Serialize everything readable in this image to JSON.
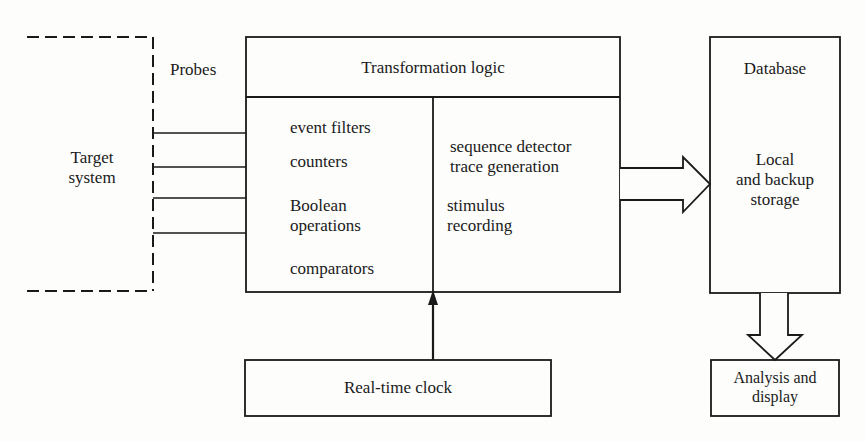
{
  "diagram": {
    "target_system": {
      "label_line1": "Target",
      "label_line2": "system",
      "style": "dashed"
    },
    "probes": {
      "label": "Probes",
      "count": 4
    },
    "transformation_logic": {
      "title": "Transformation logic",
      "left_column": [
        "event filters",
        "counters",
        "Boolean",
        "operations",
        "comparators"
      ],
      "right_column": [
        "sequence detector",
        "trace generation",
        "stimulus",
        "recording"
      ]
    },
    "database": {
      "title": "Database",
      "body_line1": "Local",
      "body_line2": "and backup",
      "body_line3": "storage"
    },
    "real_time_clock": {
      "label": "Real-time clock"
    },
    "analysis": {
      "label_line1": "Analysis and",
      "label_line2": "display"
    },
    "colors": {
      "stroke": "#1a1a1a",
      "background": "#fdfdfc"
    }
  }
}
